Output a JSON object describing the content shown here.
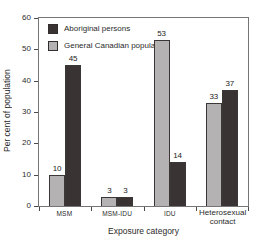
{
  "chart_data": {
    "type": "bar",
    "title": "",
    "xlabel": "Exposure category",
    "ylabel": "Per cent of population",
    "ylim": [
      0,
      60
    ],
    "yticks": [
      0,
      10,
      20,
      30,
      40,
      50,
      60
    ],
    "categories": [
      "MSM",
      "MSM-IDU",
      "IDU",
      "Heterosexual contact"
    ],
    "series": [
      {
        "name": "Aboriginal persons",
        "color": "#3a3333",
        "values": [
          45,
          3,
          14,
          37
        ]
      },
      {
        "name": "General Canadian population",
        "color": "#b4b2b2",
        "values": [
          10,
          3,
          53,
          33
        ]
      }
    ],
    "draw_order": [
      1,
      0
    ],
    "bar_value_labels": true,
    "legend_position": "top-left-inside",
    "grid": false
  }
}
